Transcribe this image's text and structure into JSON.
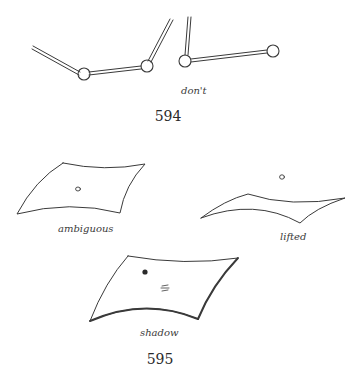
{
  "figures": [
    {
      "number": "594",
      "caption": "don't",
      "description": "Two jointed rod chains that fail to connect"
    },
    {
      "number": "595",
      "panels": [
        {
          "label": "ambiguous",
          "description": "curved sheet with small floating circle"
        },
        {
          "label": "lifted",
          "description": "thin curved sheet with circle above it"
        },
        {
          "label": "shadow",
          "description": "curved sheet with dot and shadow mark"
        }
      ]
    }
  ],
  "colors": {
    "background": "#ffffff",
    "ink": "#3a3a3a"
  }
}
